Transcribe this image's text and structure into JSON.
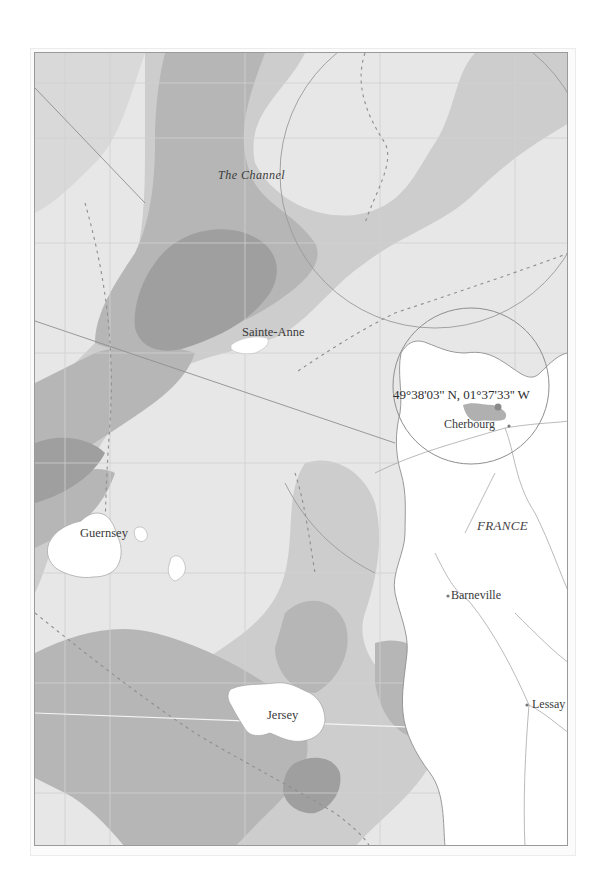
{
  "map": {
    "colors": {
      "sea_light": "#e7e7e7",
      "sea_mid": "#cdcdcd",
      "sea_dark": "#b6b6b6",
      "sea_darkest": "#9f9f9f",
      "land": "#ffffff",
      "marker": "#8a8a8a",
      "line": "#9a9a9a"
    },
    "labels": {
      "sea": "The Channel",
      "country": "FRANCE",
      "islands": [
        "Sainte-Anne",
        "Guernsey",
        "Jersey"
      ],
      "towns": [
        "Cherbourg",
        "Barneville",
        "Lessay"
      ]
    },
    "marker": {
      "coordinates": "49°38'03'' N, 01°37'33'' W",
      "location": "Cherbourg"
    }
  }
}
